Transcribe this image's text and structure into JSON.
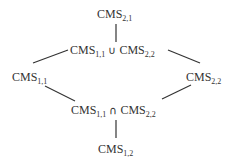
{
  "diagram": {
    "nodes": {
      "top": {
        "base": "CMS",
        "sub": "2,1"
      },
      "union_left": {
        "base": "CMS",
        "sub": "1,1"
      },
      "union_op": "∪",
      "union_right": {
        "base": "CMS",
        "sub": "2,2"
      },
      "left": {
        "base": "CMS",
        "sub": "1,1"
      },
      "right": {
        "base": "CMS",
        "sub": "2,2"
      },
      "inter_left": {
        "base": "CMS",
        "sub": "1,1"
      },
      "inter_op": "∩",
      "inter_right": {
        "base": "CMS",
        "sub": "2,2"
      },
      "bottom": {
        "base": "CMS",
        "sub": "1,2"
      }
    },
    "edges": [
      [
        "top",
        "union"
      ],
      [
        "union",
        "left"
      ],
      [
        "union",
        "right"
      ],
      [
        "left",
        "intersection"
      ],
      [
        "right",
        "intersection"
      ],
      [
        "intersection",
        "bottom"
      ]
    ],
    "line_color": "#333333"
  }
}
